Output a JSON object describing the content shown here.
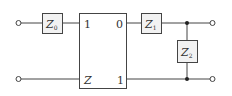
{
  "diagram": {
    "type": "two-port circuit",
    "colors": {
      "line": "#444444",
      "box_fill": "#f2f2f2",
      "text": "#333333"
    },
    "impedances": [
      {
        "id": "z0",
        "symbol": "Z",
        "subscript": "0"
      },
      {
        "id": "z1",
        "symbol": "Z",
        "subscript": "1"
      },
      {
        "id": "z2",
        "symbol": "Z",
        "subscript": "2"
      }
    ],
    "block": {
      "top_left_label": "1",
      "top_right_label": "0",
      "bottom_left_label": "Z",
      "bottom_right_label": "1"
    },
    "terminals": [
      "input-top",
      "input-bottom",
      "output-top",
      "output-bottom"
    ]
  }
}
